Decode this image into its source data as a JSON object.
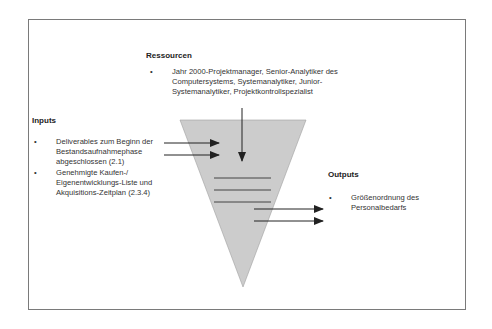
{
  "resources": {
    "heading": "Ressourcen",
    "items": [
      {
        "bullet": "•",
        "text": "Jahr 2000-Projektmanager, Senior-Analytiker des Computersystems, Systemanalytiker, Junior-Systemanalytiker, Projektkontrollspezialist"
      }
    ]
  },
  "inputs": {
    "heading": "Inputs",
    "items": [
      {
        "bullet": "•",
        "text": "Deliverables zum Beginn der Bestandsaufnahmephase abgeschlossen (2.1)"
      },
      {
        "bullet": "•",
        "text": "Genehmigte Kaufen-/ Eigenentwicklungs-Liste und Akquisitions-Zeitplan (2.3.4)"
      }
    ]
  },
  "outputs": {
    "heading": "Outputs",
    "items": [
      {
        "bullet": "•",
        "text": "Größenordnung des Personalbedarfs"
      }
    ]
  },
  "colors": {
    "funnel_fill": "#cccccc",
    "funnel_stroke": "#9a9a9a",
    "arrow": "#222222",
    "frame": "#7a7a7a"
  }
}
